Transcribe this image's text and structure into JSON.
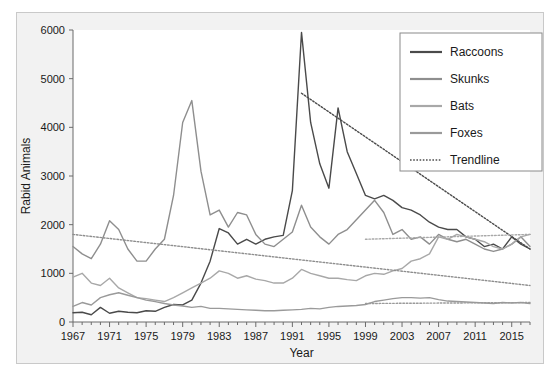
{
  "chart_data": {
    "type": "line",
    "title": "",
    "xlabel": "Year",
    "ylabel": "Rabid Animals",
    "xlim": [
      1967,
      2017
    ],
    "ylim": [
      0,
      6000
    ],
    "grid": false,
    "legend_position": "top-right",
    "x_ticks": [
      "1967",
      "1971",
      "1975",
      "1979",
      "1983",
      "1987",
      "1991",
      "1995",
      "1999",
      "2003",
      "2007",
      "2011",
      "2015"
    ],
    "y_ticks": [
      "0",
      "1000",
      "2000",
      "3000",
      "4000",
      "5000",
      "6000"
    ],
    "x": [
      1967,
      1968,
      1969,
      1970,
      1971,
      1972,
      1973,
      1974,
      1975,
      1976,
      1977,
      1978,
      1979,
      1980,
      1981,
      1982,
      1983,
      1984,
      1985,
      1986,
      1987,
      1988,
      1989,
      1990,
      1991,
      1992,
      1993,
      1994,
      1995,
      1996,
      1997,
      1998,
      1999,
      2000,
      2001,
      2002,
      2003,
      2004,
      2005,
      2006,
      2007,
      2008,
      2009,
      2010,
      2011,
      2012,
      2013,
      2014,
      2015,
      2016,
      2017
    ],
    "series": [
      {
        "name": "Raccoons",
        "color": "#4a4a4a",
        "values": [
          190,
          200,
          150,
          300,
          180,
          220,
          200,
          190,
          230,
          220,
          300,
          360,
          350,
          450,
          800,
          1250,
          1920,
          1830,
          1600,
          1700,
          1600,
          1700,
          1750,
          1780,
          2700,
          5950,
          4100,
          3250,
          2750,
          4400,
          3500,
          3050,
          2600,
          2530,
          2600,
          2500,
          2350,
          2300,
          2200,
          2050,
          1950,
          1900,
          1900,
          1750,
          1700,
          1550,
          1600,
          1500,
          1750,
          1600,
          1500
        ]
      },
      {
        "name": "Skunks",
        "color": "#8e8e8e",
        "values": [
          1550,
          1400,
          1300,
          1600,
          2080,
          1900,
          1500,
          1250,
          1250,
          1500,
          1700,
          2600,
          4100,
          4550,
          3100,
          2200,
          2300,
          1950,
          2250,
          2200,
          1800,
          1600,
          1550,
          1700,
          1850,
          2400,
          1950,
          1750,
          1600,
          1800,
          1900,
          2100,
          2300,
          2500,
          2250,
          1800,
          1900,
          1700,
          1750,
          1600,
          1800,
          1700,
          1650,
          1700,
          1600,
          1500,
          1450,
          1500,
          1600,
          1750,
          1550
        ]
      },
      {
        "name": "Bats",
        "color": "#a8a8a8",
        "values": [
          920,
          1000,
          800,
          750,
          900,
          700,
          600,
          500,
          480,
          450,
          420,
          500,
          600,
          700,
          800,
          900,
          1050,
          1000,
          900,
          950,
          880,
          850,
          800,
          800,
          900,
          1080,
          1000,
          950,
          900,
          900,
          870,
          850,
          950,
          1000,
          980,
          1050,
          1100,
          1250,
          1300,
          1400,
          1750,
          1700,
          1800,
          1750,
          1700,
          1650,
          1550,
          1500,
          1600,
          1750,
          1800
        ]
      },
      {
        "name": "Foxes",
        "color": "#9a9a9a",
        "values": [
          320,
          400,
          350,
          500,
          560,
          600,
          550,
          500,
          450,
          420,
          380,
          350,
          330,
          300,
          320,
          280,
          280,
          270,
          260,
          250,
          240,
          230,
          230,
          240,
          250,
          260,
          280,
          270,
          300,
          320,
          330,
          340,
          360,
          420,
          450,
          480,
          500,
          500,
          490,
          500,
          460,
          430,
          420,
          410,
          400,
          390,
          380,
          400,
          390,
          400,
          380
        ]
      }
    ],
    "trendlines": [
      {
        "name": "Raccoons Trendline",
        "for_series": "Raccoons",
        "color": "#4a4a4a",
        "x0": 1992,
        "y0": 4700,
        "x1": 2017,
        "y1": 1500
      },
      {
        "name": "Skunks Trendline",
        "for_series": "Skunks",
        "color": "#8e8e8e",
        "x0": 1967,
        "y0": 1800,
        "x1": 2017,
        "y1": 750
      },
      {
        "name": "Bats Trendline",
        "for_series": "Bats",
        "color": "#a8a8a8",
        "x0": 1999,
        "y0": 1700,
        "x1": 2017,
        "y1": 1800
      },
      {
        "name": "Foxes Trendline",
        "for_series": "Foxes",
        "color": "#9a9a9a",
        "x0": 1999,
        "y0": 380,
        "x1": 2017,
        "y1": 400
      }
    ],
    "legend": [
      {
        "label": "Raccoons",
        "color": "#4a4a4a",
        "style": "solid"
      },
      {
        "label": "Skunks",
        "color": "#8e8e8e",
        "style": "solid"
      },
      {
        "label": "Bats",
        "color": "#a8a8a8",
        "style": "solid"
      },
      {
        "label": "Foxes",
        "color": "#9a9a9a",
        "style": "solid"
      },
      {
        "label": "Trendline",
        "color": "#7a7a7a",
        "style": "dotted"
      }
    ]
  },
  "figure": {
    "background_color": "#f2f2f2",
    "plot_background_color": "#ffffff",
    "border_color": "#c9c9c9",
    "axis_color": "#6b6b6b",
    "text_color": "#1a1a1a"
  }
}
